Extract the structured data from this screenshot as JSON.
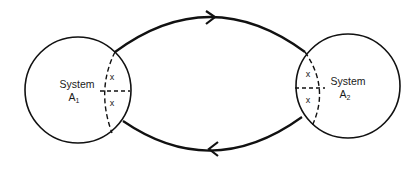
{
  "diagram": {
    "type": "two-system exchange cycle",
    "systems": [
      {
        "id": "A1",
        "label": "System",
        "symbol": "A",
        "subscript": "1",
        "markers": [
          "x",
          "x"
        ]
      },
      {
        "id": "A2",
        "label": "System",
        "symbol": "A",
        "subscript": "2",
        "markers": [
          "x",
          "x"
        ]
      }
    ],
    "flows": [
      {
        "from": "A1",
        "to": "A2",
        "direction": "right",
        "position": "top"
      },
      {
        "from": "A2",
        "to": "A1",
        "direction": "left",
        "position": "bottom"
      }
    ],
    "colors": {
      "stroke": "#111111",
      "background": "#ffffff"
    }
  }
}
